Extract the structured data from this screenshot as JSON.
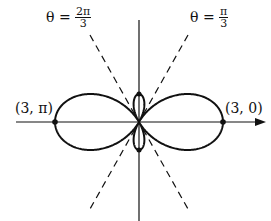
{
  "figure": {
    "curve": "r = 1 + 2cos(2θ)",
    "labels": {
      "line_left_theta": "θ =",
      "line_left_num": "2π",
      "line_left_den": "3",
      "line_right_theta": "θ =",
      "line_right_num": "π",
      "line_right_den": "3",
      "point_left": "(3, π)",
      "point_right": "(3, 0)"
    },
    "colors": {
      "stroke": "#111111",
      "background": "#ffffff"
    }
  }
}
